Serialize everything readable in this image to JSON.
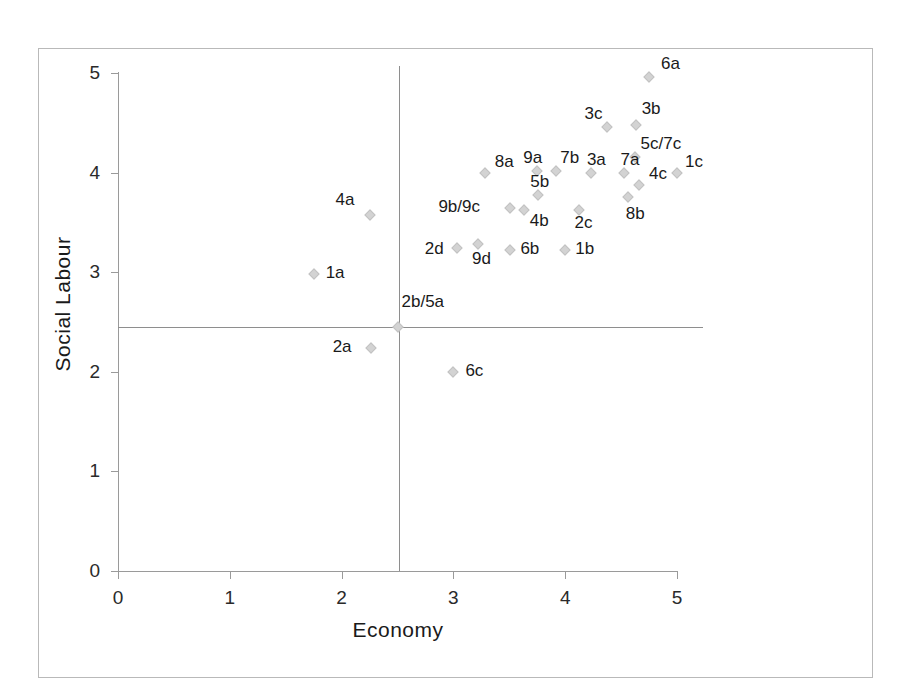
{
  "chart_data": {
    "type": "scatter",
    "title": "",
    "xlabel": "Economy",
    "ylabel": "Social Labour",
    "xlim": [
      0,
      5
    ],
    "ylim": [
      0,
      5
    ],
    "xticks": [
      0,
      1,
      2,
      3,
      4,
      5
    ],
    "yticks": [
      0,
      1,
      2,
      3,
      4,
      5
    ],
    "xtick_labels": [
      "0",
      "1",
      "2",
      "3",
      "4",
      "5"
    ],
    "ytick_labels": [
      "0",
      "1",
      "2",
      "3",
      "4",
      "5"
    ],
    "grid": false,
    "legend": "none",
    "marker": "diamond",
    "marker_color": "#d3d3d3",
    "reference_lines": [
      {
        "axis": "vertical",
        "value": 2.5
      },
      {
        "axis": "horizontal",
        "value": 2.45
      }
    ],
    "points": [
      {
        "label": "6a",
        "x": 4.75,
        "y": 4.96,
        "lx": 12,
        "ly": -22
      },
      {
        "label": "3c",
        "x": 4.37,
        "y": 4.46,
        "lx": -22,
        "ly": -22
      },
      {
        "label": "3b",
        "x": 4.63,
        "y": 4.48,
        "lx": 6,
        "ly": -25
      },
      {
        "label": "5c/7c",
        "x": 4.62,
        "y": 4.16,
        "lx": 6,
        "ly": -22
      },
      {
        "label": "9a",
        "x": 3.75,
        "y": 4.02,
        "lx": -14,
        "ly": -22
      },
      {
        "label": "7b",
        "x": 3.92,
        "y": 4.02,
        "lx": 4,
        "ly": -22
      },
      {
        "label": "3a",
        "x": 4.23,
        "y": 4.0,
        "lx": -4,
        "ly": -22
      },
      {
        "label": "7a",
        "x": 4.53,
        "y": 4.0,
        "lx": -4,
        "ly": -22
      },
      {
        "label": "1c",
        "x": 5.0,
        "y": 4.0,
        "lx": 8,
        "ly": -20
      },
      {
        "label": "8a",
        "x": 3.28,
        "y": 4.0,
        "lx": 10,
        "ly": -20
      },
      {
        "label": "4c",
        "x": 4.66,
        "y": 3.88,
        "lx": 10,
        "ly": -20
      },
      {
        "label": "5b",
        "x": 3.76,
        "y": 3.78,
        "lx": -8,
        "ly": -22
      },
      {
        "label": "9b/9c",
        "x": 3.51,
        "y": 3.64,
        "lx": -72,
        "ly": -10
      },
      {
        "label": "4b",
        "x": 3.63,
        "y": 3.62,
        "lx": 6,
        "ly": 2
      },
      {
        "label": "2c",
        "x": 4.12,
        "y": 3.62,
        "lx": -4,
        "ly": 4
      },
      {
        "label": "8b",
        "x": 4.56,
        "y": 3.76,
        "lx": -2,
        "ly": 8
      },
      {
        "label": "4a",
        "x": 2.25,
        "y": 3.57,
        "lx": -34,
        "ly": -24
      },
      {
        "label": "2d",
        "x": 3.03,
        "y": 3.24,
        "lx": -32,
        "ly": -8
      },
      {
        "label": "9d",
        "x": 3.22,
        "y": 3.28,
        "lx": -6,
        "ly": 6
      },
      {
        "label": "6b",
        "x": 3.51,
        "y": 3.22,
        "lx": 10,
        "ly": -10
      },
      {
        "label": "1b",
        "x": 4.0,
        "y": 3.22,
        "lx": 10,
        "ly": -10
      },
      {
        "label": "1a",
        "x": 1.75,
        "y": 2.98,
        "lx": 12,
        "ly": -10
      },
      {
        "label": "2b/5a",
        "x": 2.5,
        "y": 2.45,
        "lx": 4,
        "ly": -34
      },
      {
        "label": "2a",
        "x": 2.26,
        "y": 2.24,
        "lx": -38,
        "ly": -10
      },
      {
        "label": "6c",
        "x": 3.0,
        "y": 2.0,
        "lx": 12,
        "ly": -10
      }
    ]
  }
}
